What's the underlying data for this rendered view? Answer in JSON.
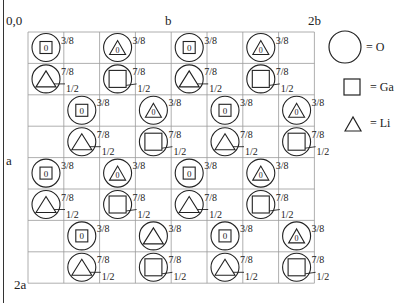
{
  "axes": {
    "origin": "0,0",
    "b": "b",
    "two_b": "2b",
    "a": "a",
    "two_a": "2a"
  },
  "legend": [
    {
      "symbol": "circle",
      "label": "= O"
    },
    {
      "symbol": "square",
      "label": "= Ga"
    },
    {
      "symbol": "triangle",
      "label": "= Li"
    }
  ],
  "grid": {
    "columns": 8,
    "rows": 8
  },
  "colors": {
    "line": "#222222",
    "grid": "#9a9a9a"
  },
  "height_labels": {
    "upper": "3/8",
    "lower": "7/8",
    "half": "1/2",
    "zero": "0"
  },
  "atoms": [
    {
      "row": 0,
      "col": 0,
      "cation": "Ga",
      "zero": true,
      "z": "3/8"
    },
    {
      "row": 0,
      "col": 2,
      "cation": "Li",
      "zero": true,
      "z": "3/8"
    },
    {
      "row": 0,
      "col": 4,
      "cation": "Ga",
      "zero": true,
      "z": "3/8"
    },
    {
      "row": 0,
      "col": 6,
      "cation": "Li",
      "zero": true,
      "z": "3/8"
    },
    {
      "row": 1,
      "col": 0,
      "cation": "Li",
      "zero": false,
      "z": "7/8",
      "half": "1/2"
    },
    {
      "row": 1,
      "col": 2,
      "cation": "Ga",
      "zero": false,
      "z": "7/8",
      "half": "1/2"
    },
    {
      "row": 1,
      "col": 4,
      "cation": "Li",
      "zero": false,
      "z": "7/8",
      "half": "1/2"
    },
    {
      "row": 1,
      "col": 6,
      "cation": "Ga",
      "zero": false,
      "z": "7/8",
      "half": "1/2"
    },
    {
      "row": 2,
      "col": 1,
      "cation": "Ga",
      "zero": true,
      "z": "3/8"
    },
    {
      "row": 2,
      "col": 3,
      "cation": "Li",
      "zero": true,
      "z": "3/8"
    },
    {
      "row": 2,
      "col": 5,
      "cation": "Ga",
      "zero": true,
      "z": "3/8"
    },
    {
      "row": 2,
      "col": 7,
      "cation": "Li",
      "zero": true,
      "z": "3/8"
    },
    {
      "row": 3,
      "col": 1,
      "cation": "Li",
      "zero": false,
      "z": "7/8",
      "half": "1/2"
    },
    {
      "row": 3,
      "col": 3,
      "cation": "Ga",
      "zero": false,
      "z": "7/8",
      "half": "1/2"
    },
    {
      "row": 3,
      "col": 5,
      "cation": "Li",
      "zero": false,
      "z": "7/8",
      "half": "1/2"
    },
    {
      "row": 3,
      "col": 7,
      "cation": "Ga",
      "zero": false,
      "z": "7/8",
      "half": "1/2"
    },
    {
      "row": 4,
      "col": 0,
      "cation": "Ga",
      "zero": true,
      "z": "3/8"
    },
    {
      "row": 4,
      "col": 2,
      "cation": "Li",
      "zero": true,
      "z": "3/8"
    },
    {
      "row": 4,
      "col": 4,
      "cation": "Ga",
      "zero": true,
      "z": "3/8"
    },
    {
      "row": 4,
      "col": 6,
      "cation": "Li",
      "zero": true,
      "z": "3/8"
    },
    {
      "row": 5,
      "col": 0,
      "cation": "Li",
      "zero": false,
      "z": "7/8",
      "half": "1/2"
    },
    {
      "row": 5,
      "col": 2,
      "cation": "Ga",
      "zero": false,
      "z": "7/8",
      "half": "1/2"
    },
    {
      "row": 5,
      "col": 4,
      "cation": "Li",
      "zero": false,
      "z": "7/8",
      "half": "1/2"
    },
    {
      "row": 5,
      "col": 6,
      "cation": "Ga",
      "zero": false,
      "z": "7/8",
      "half": "1/2"
    },
    {
      "row": 6,
      "col": 1,
      "cation": "Ga",
      "zero": true,
      "z": "3/8"
    },
    {
      "row": 6,
      "col": 3,
      "cation": "Li",
      "zero": false,
      "z": "3/8"
    },
    {
      "row": 6,
      "col": 5,
      "cation": "Ga",
      "zero": true,
      "z": "3/8"
    },
    {
      "row": 6,
      "col": 7,
      "cation": "Li",
      "zero": true,
      "z": "3/8"
    },
    {
      "row": 7,
      "col": 1,
      "cation": "Li",
      "zero": false,
      "z": "7/8",
      "half": "1/2"
    },
    {
      "row": 7,
      "col": 3,
      "cation": "Ga",
      "zero": false,
      "z": "7/8",
      "half": "1/2"
    },
    {
      "row": 7,
      "col": 5,
      "cation": "Li",
      "zero": false,
      "z": "7/8",
      "half": "1/2"
    },
    {
      "row": 7,
      "col": 7,
      "cation": "Ga",
      "zero": false,
      "z": "7/8",
      "half": "1/2"
    }
  ]
}
